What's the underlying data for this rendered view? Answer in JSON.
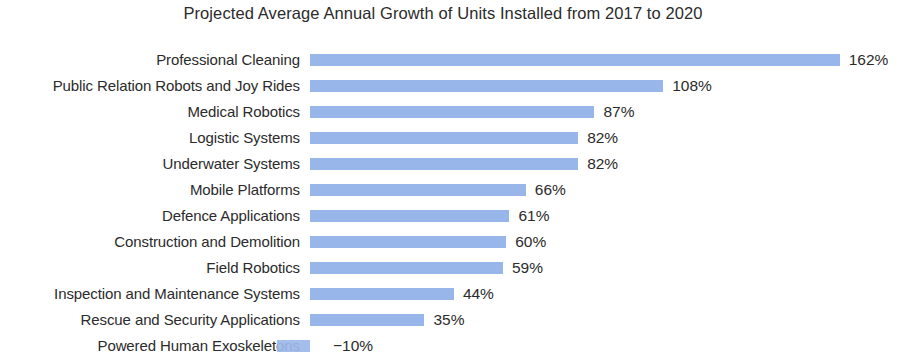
{
  "chart_data": {
    "type": "bar",
    "orientation": "horizontal",
    "title": "Projected Average Annual Growth of Units Installed from 2017 to 2020",
    "xlabel": "",
    "ylabel": "",
    "grid": false,
    "legend": "none",
    "bar_color": "#8fb0e8",
    "text_color": "#2b2b2b",
    "value_suffix": "%",
    "xlim": [
      -20,
      180
    ],
    "categories": [
      "Professional Cleaning",
      "Public Relation Robots and Joy Rides",
      "Medical Robotics",
      "Logistic Systems",
      "Underwater Systems",
      "Mobile Platforms",
      "Defence Applications",
      "Construction and Demolition",
      "Field Robotics",
      "Inspection and Maintenance Systems",
      "Rescue and Security Applications",
      "Powered Human Exoskeletons"
    ],
    "values": [
      162,
      108,
      87,
      82,
      82,
      66,
      61,
      60,
      59,
      44,
      35,
      -10
    ],
    "value_labels": [
      "162%",
      "108%",
      "87%",
      "82%",
      "82%",
      "66%",
      "61%",
      "60%",
      "59%",
      "44%",
      "35%",
      "−10%"
    ]
  }
}
